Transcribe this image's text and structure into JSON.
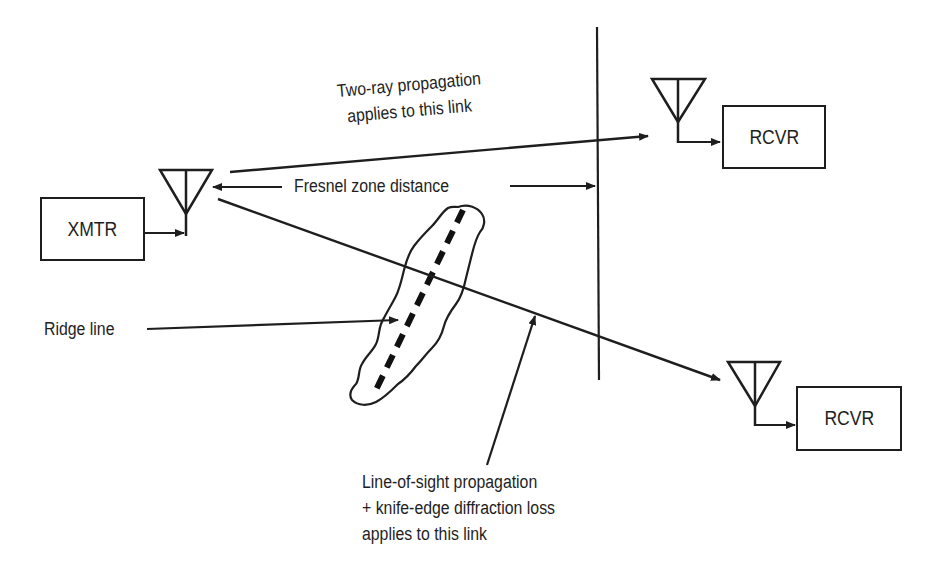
{
  "diagram": {
    "transmitter": {
      "label": "XMTR"
    },
    "receiver_top": {
      "label": "RCVR"
    },
    "receiver_bottom": {
      "label": "RCVR"
    },
    "labels": {
      "two_ray_line1": "Two-ray propagation",
      "two_ray_line2": "applies to this link",
      "fresnel": "Fresnel zone distance",
      "ridge": "Ridge line",
      "los_line1": "Line-of-sight propagation",
      "los_line2": "+ knife-edge diffraction loss",
      "los_line3": "applies to this link"
    },
    "colors": {
      "stroke": "#1e1e1e",
      "background": "#ffffff"
    }
  }
}
